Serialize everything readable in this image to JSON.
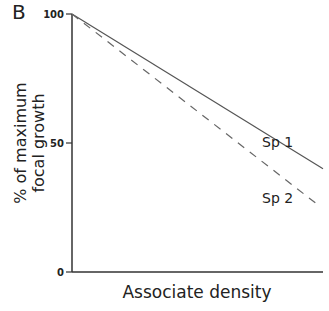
{
  "panel_label": "B",
  "chart_data": {
    "type": "line",
    "title": "",
    "xlabel": "Associate density",
    "ylabel_line1": "% of maximum",
    "ylabel_line2": "focal growth",
    "ylim": [
      0,
      100
    ],
    "yticks": [
      "0",
      "50",
      "100"
    ],
    "x": [
      0,
      1
    ],
    "series": [
      {
        "name": "Sp 1",
        "style": "solid",
        "values": [
          100,
          40
        ]
      },
      {
        "name": "Sp 2",
        "style": "dashed",
        "values": [
          100,
          26
        ]
      }
    ],
    "annotations": [
      "Sp 1",
      "Sp 2"
    ],
    "grid": false,
    "legend": "inline labels"
  }
}
